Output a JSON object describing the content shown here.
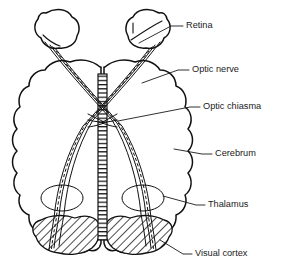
{
  "figure": {
    "background_color": "#ffffff",
    "ink_color": "#111111",
    "text_color": "#1a1a1a",
    "width": 291,
    "height": 274
  },
  "labels": [
    {
      "id": "retina",
      "text": "Retina",
      "text_x": 186,
      "text_y": 26,
      "leader": "M 183 26 L 171 26 L 139 43",
      "target": "right eyeball"
    },
    {
      "id": "optic-nerve",
      "text": "Optic nerve",
      "text_x": 192,
      "text_y": 70,
      "leader": "M 189 70 L 178 70 L 142 83",
      "target": "right optic nerve trunk"
    },
    {
      "id": "optic-chiasma",
      "text": "Optic chiasma",
      "text_x": 203,
      "text_y": 107,
      "leader": "M 200 107 L 190 107 L 118 121",
      "target": "crossing point of the optic tracts"
    },
    {
      "id": "cerebrum",
      "text": "Cerebrum",
      "text_x": 215,
      "text_y": 154,
      "leader": "M 212 154 L 202 154 L 174 149",
      "target": "right cerebral hemisphere"
    },
    {
      "id": "thalamus",
      "text": "Thalamus",
      "text_x": 208,
      "text_y": 205,
      "leader": "M 205 205 L 196 205 L 163 196",
      "target": "right thalamus ring"
    },
    {
      "id": "visual-cortex",
      "text": "Visual cortex",
      "text_x": 195,
      "text_y": 254,
      "leader": "M 192 254 L 183 254 L 160 240",
      "target": "right occipital visual cortex"
    }
  ],
  "structures": [
    {
      "id": "left-eyeball",
      "name": "left retina / eyeball",
      "interactable": false
    },
    {
      "id": "right-eyeball",
      "name": "right retina / eyeball",
      "interactable": false
    },
    {
      "id": "left-hemisphere",
      "name": "left cerebral hemisphere",
      "interactable": false
    },
    {
      "id": "right-hemisphere",
      "name": "right cerebral hemisphere",
      "interactable": false
    },
    {
      "id": "midline-band",
      "name": "hatched midline band",
      "interactable": false
    },
    {
      "id": "optic-chiasma-cross",
      "name": "optic chiasma crossing",
      "interactable": false
    },
    {
      "id": "left-thalamus",
      "name": "left thalamus",
      "interactable": false
    },
    {
      "id": "right-thalamus",
      "name": "right thalamus",
      "interactable": false
    },
    {
      "id": "left-visual-cortex",
      "name": "left visual cortex",
      "interactable": false
    },
    {
      "id": "right-visual-cortex",
      "name": "right visual cortex",
      "interactable": false
    }
  ]
}
